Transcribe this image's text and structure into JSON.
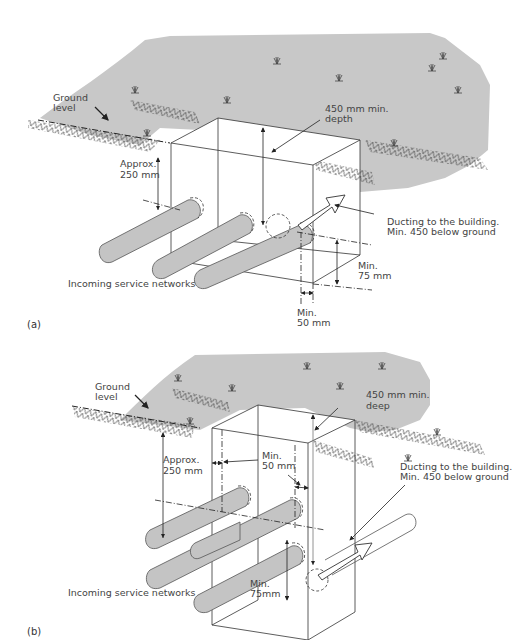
{
  "figure": {
    "panels": [
      {
        "id": "a",
        "panel_label": "(a)",
        "labels": {
          "ground_level_1": "Ground",
          "ground_level_2": "level",
          "depth_1": "450 mm min.",
          "depth_2": "depth",
          "approx_1": "Approx.",
          "approx_2": "250 mm",
          "ducting_1": "Ducting to the building.",
          "ducting_2": "Min. 450 below ground",
          "min75_1": "Min.",
          "min75_2": "75 mm",
          "min50_1": "Min.",
          "min50_2": "50 mm",
          "incoming": "Incoming  service networks"
        }
      },
      {
        "id": "b",
        "panel_label": "(b)",
        "labels": {
          "ground_level_1": "Ground",
          "ground_level_2": "level",
          "depth_1": "450 mm min.",
          "depth_2": "deep",
          "approx_1": "Approx.",
          "approx_2": "250 mm",
          "min50_1": "Min.",
          "min50_2": "50 mm",
          "ducting_1": "Ducting to the building.",
          "ducting_2": "Min. 450 below ground",
          "min75_1": "Min.",
          "min75_2": "75mm",
          "incoming": "Incoming  service networks"
        }
      }
    ],
    "colors": {
      "ground": "#c8c8c8",
      "pipe": "#c4c4c4",
      "line": "#333333",
      "text": "#444444"
    }
  }
}
